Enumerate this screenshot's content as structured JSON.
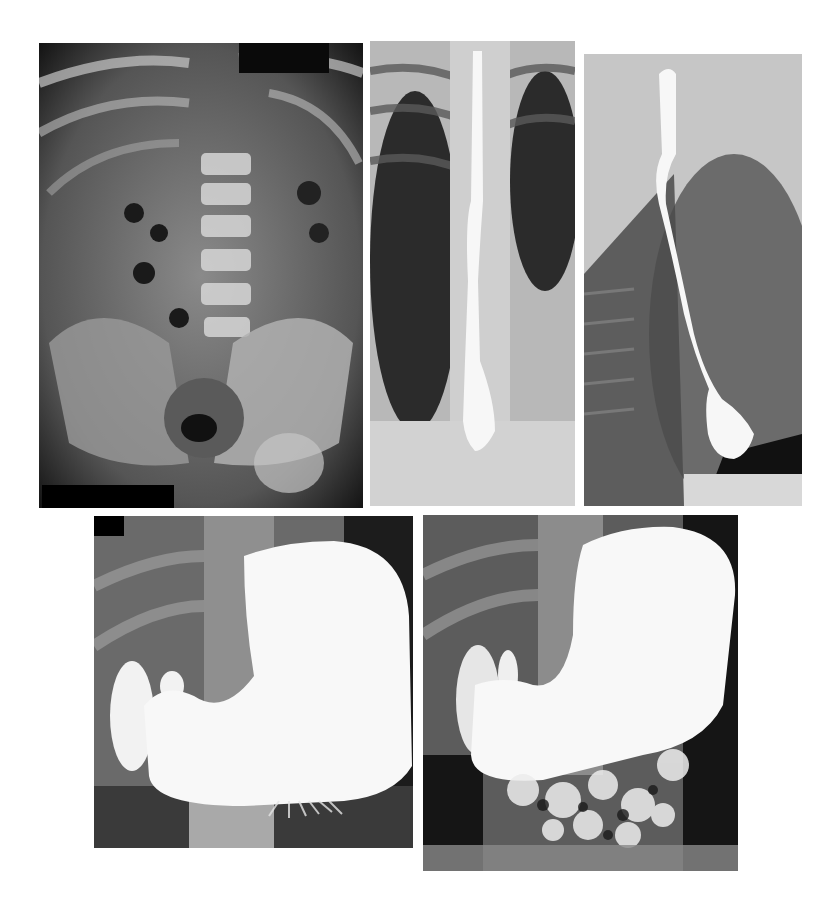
{
  "figure": {
    "background": "#ffffff",
    "panels": [
      {
        "id": "A",
        "description": "Plain abdominal radiograph (AP): lumbar spine, ribs, bowel gas, pelvis",
        "box": {
          "x": 39,
          "y": 43,
          "w": 324,
          "h": 465
        },
        "redaction": {
          "x": 3,
          "y": 442,
          "w": 132,
          "h": 23
        }
      },
      {
        "id": "B",
        "description": "Barium esophagram, frontal view: contrast-filled esophagus in the mediastinum with a distal dilated segment",
        "box": {
          "x": 370,
          "y": 41,
          "w": 205,
          "h": 465
        }
      },
      {
        "id": "C",
        "description": "Barium esophagram, lateral/oblique view: tortuous contrast-filled esophagus ending in a bulbous distal segment",
        "box": {
          "x": 584,
          "y": 54,
          "w": 218,
          "h": 452
        }
      },
      {
        "id": "D",
        "description": "Upper GI barium study: large contrast-filled stomach and duodenal cap, early small bowel filling",
        "box": {
          "x": 94,
          "y": 516,
          "w": 319,
          "h": 332
        },
        "redaction": {
          "x": 0,
          "y": 0,
          "w": 30,
          "h": 20
        }
      },
      {
        "id": "E",
        "description": "Upper GI barium study, later phase: contrast-filled stomach with extensive small bowel filling",
        "box": {
          "x": 423,
          "y": 515,
          "w": 315,
          "h": 356
        }
      }
    ]
  }
}
